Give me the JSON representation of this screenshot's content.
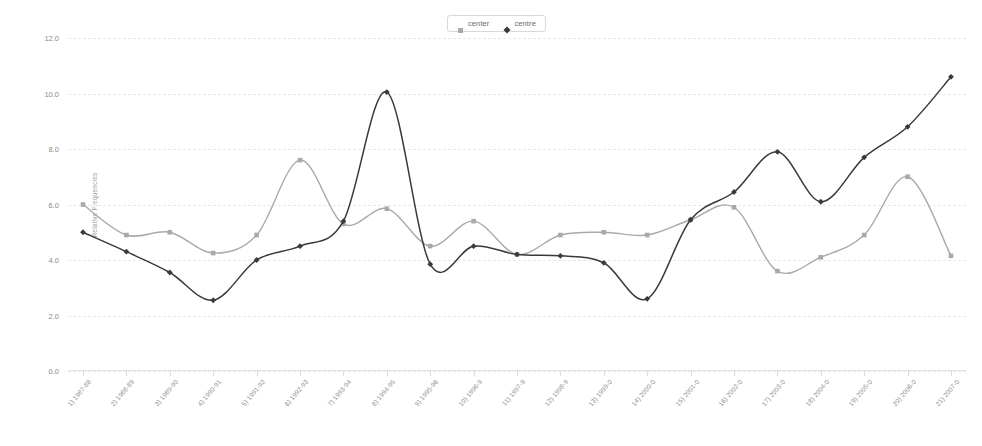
{
  "legend": {
    "position": "top-center",
    "items": [
      {
        "label": "center",
        "marker": "square-marker",
        "color": "#a9a9a9"
      },
      {
        "label": "centre",
        "marker": "diamond-marker",
        "color": "#3a3a3a"
      }
    ]
  },
  "chart_data": {
    "type": "line",
    "title": "",
    "xlabel": "",
    "ylabel": "Relative Frequencies",
    "ylim": [
      0.0,
      12.0
    ],
    "yticks": [
      "0.0",
      "2.0",
      "4.0",
      "6.0",
      "8.0",
      "10.0",
      "12.0"
    ],
    "grid": true,
    "categories": [
      "1) 1987-88",
      "2) 1988-89",
      "3) 1989-90",
      "4) 1990-91",
      "5) 1991-92",
      "6) 1992-93",
      "7) 1993-94",
      "8) 1994-95",
      "9) 1995-96",
      "10) 1996-9",
      "11) 1997-9",
      "12) 1998-9",
      "13) 1999-0",
      "14) 2000-0",
      "15) 2001-0",
      "16) 2002-0",
      "17) 2003-0",
      "18) 2004-0",
      "19) 2005-0",
      "20) 2006-0",
      "21) 2007-0"
    ],
    "series": [
      {
        "name": "center",
        "color": "#a9a9a9",
        "marker": "square-marker",
        "values": [
          6.0,
          4.9,
          5.0,
          4.25,
          4.9,
          7.6,
          5.3,
          5.85,
          4.5,
          5.4,
          4.2,
          4.9,
          5.0,
          4.9,
          5.45,
          5.9,
          3.6,
          4.1,
          4.9,
          7.0,
          4.15
        ]
      },
      {
        "name": "centre",
        "color": "#3a3a3a",
        "marker": "diamond-marker",
        "values": [
          5.0,
          4.3,
          3.55,
          2.55,
          4.0,
          4.5,
          5.4,
          10.05,
          3.85,
          4.5,
          4.2,
          4.15,
          3.9,
          2.6,
          5.45,
          6.45,
          7.9,
          6.1,
          7.7,
          8.8,
          10.6
        ]
      }
    ]
  }
}
